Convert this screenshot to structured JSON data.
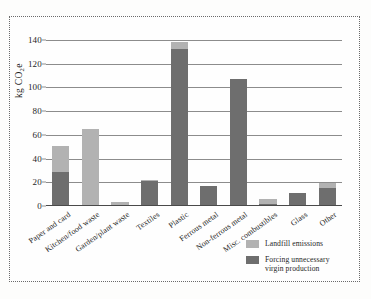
{
  "chart_data": {
    "type": "bar",
    "title": "",
    "subtitle": "",
    "xlabel": "",
    "ylabel": "kg CO2e",
    "ylabel_parts": {
      "prefix": "kg CO",
      "sub": "2",
      "suffix": "e"
    },
    "ylim": [
      0,
      145
    ],
    "yticks": [
      0,
      20,
      40,
      60,
      80,
      100,
      120,
      140
    ],
    "ytick_labels": [
      "0",
      "20",
      "40",
      "60",
      "80",
      "100",
      "120",
      "140"
    ],
    "grid": true,
    "grid_axis": "y",
    "legend_position": "bottom-right",
    "stacked": true,
    "categories": [
      "Paper and card",
      "Kitchen/food waste",
      "Garden/plant waste",
      "Textiles",
      "Plastic",
      "Ferrous metal",
      "Non-ferrous metal",
      "Misc. combustibles",
      "Glass",
      "Other"
    ],
    "series": [
      {
        "name": "Forcing unnecessary virgin production",
        "color": "#6e6e6e",
        "values": [
          29,
          0,
          0,
          21,
          132,
          17,
          107,
          2,
          11,
          15
        ]
      },
      {
        "name": "Landfill emissions",
        "color": "#b2b2b2",
        "values": [
          22,
          65,
          3,
          1,
          6,
          0,
          0,
          4,
          0,
          4
        ]
      }
    ],
    "totals": [
      51,
      65,
      3,
      22,
      138,
      17,
      107,
      6,
      11,
      19
    ]
  },
  "legend": {
    "items": [
      {
        "label": "Landfill emissions",
        "swatch": "landfill"
      },
      {
        "label": "Forcing unnecessary virgin production",
        "swatch": "virgin"
      }
    ],
    "item_0_label": "Landfill emissions",
    "item_1_line_1": "Forcing unnecessary",
    "item_1_line_2": "virgin production"
  },
  "colors": {
    "landfill": "#b2b2b2",
    "virgin": "#6e6e6e",
    "grid": "#8c8c8c",
    "frame": "#6a6a6a",
    "text": "#1f1f1f",
    "background": "#fefefe"
  }
}
